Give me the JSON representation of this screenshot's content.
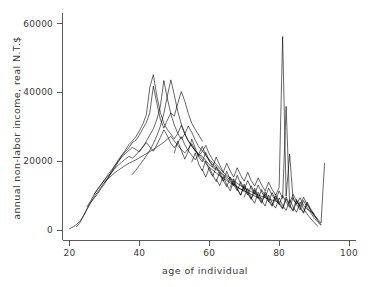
{
  "chart_data": {
    "type": "line",
    "title": "",
    "xlabel": "age of individual",
    "ylabel": "annual non-labor income, real N.T.$",
    "xlim": [
      18,
      102
    ],
    "ylim": [
      -3000,
      63000
    ],
    "grid": false,
    "legend": null,
    "xticks": [
      20,
      40,
      60,
      80,
      100
    ],
    "xtick_labels": [
      "20",
      "40",
      "60",
      "80",
      "100"
    ],
    "yticks": [
      0,
      20000,
      40000,
      60000
    ],
    "ytick_labels": [
      "0",
      "20000",
      "40000",
      "60000"
    ],
    "series": [
      {
        "name": "cohort-1",
        "x": [
          20,
          21,
          22,
          23,
          24,
          25,
          26,
          27,
          28,
          29,
          30,
          31,
          32,
          33,
          34,
          35,
          36,
          37,
          38,
          39,
          40,
          41,
          42,
          43,
          44,
          45,
          46,
          47,
          48,
          49,
          50,
          51,
          52,
          53,
          54,
          55,
          56,
          57,
          58
        ],
        "y": [
          400,
          900,
          1600,
          2600,
          4200,
          6200,
          8000,
          9200,
          10500,
          12000,
          13400,
          15000,
          16600,
          18200,
          19900,
          21600,
          22800,
          23900,
          25400,
          26100,
          27600,
          29500,
          31200,
          34200,
          41800,
          36800,
          32200,
          29600,
          31900,
          34000,
          33100,
          36800,
          40200,
          37400,
          33900,
          31000,
          29200,
          27600,
          25800
        ]
      },
      {
        "name": "cohort-2",
        "x": [
          22,
          23,
          24,
          25,
          26,
          27,
          28,
          29,
          30,
          31,
          32,
          33,
          34,
          35,
          36,
          37,
          38,
          39,
          40,
          41,
          42,
          43,
          44,
          45,
          46,
          47,
          48,
          49,
          50,
          51,
          52,
          53,
          54,
          55,
          56,
          57,
          58,
          59,
          60,
          61,
          62
        ],
        "y": [
          1000,
          2200,
          4100,
          6000,
          7800,
          9600,
          11000,
          12400,
          13900,
          15100,
          16900,
          18700,
          20400,
          21800,
          23200,
          24800,
          25900,
          27100,
          28800,
          30800,
          33500,
          41500,
          45100,
          38900,
          34200,
          31000,
          29200,
          27900,
          26500,
          28100,
          30400,
          27900,
          25800,
          24400,
          23100,
          22000,
          21400,
          20200,
          19000,
          18200,
          17500
        ]
      },
      {
        "name": "cohort-3",
        "x": [
          25,
          26,
          27,
          28,
          29,
          30,
          31,
          32,
          33,
          34,
          35,
          36,
          37,
          38,
          39,
          40,
          41,
          42,
          43,
          44,
          45,
          46,
          47,
          48,
          49,
          50,
          51,
          52,
          53,
          54,
          55,
          56,
          57,
          58,
          59,
          60,
          61,
          62,
          63,
          64,
          65,
          66
        ],
        "y": [
          6800,
          8400,
          10200,
          11800,
          13200,
          14600,
          16100,
          17400,
          18800,
          20000,
          21300,
          22200,
          23100,
          24000,
          23400,
          22700,
          24100,
          25800,
          27600,
          29400,
          32100,
          35900,
          43400,
          38200,
          33800,
          30500,
          28100,
          26400,
          27900,
          30200,
          28400,
          26100,
          24200,
          23000,
          21700,
          20400,
          19600,
          18400,
          17200,
          16100,
          15400,
          14600
        ]
      },
      {
        "name": "cohort-4",
        "x": [
          27,
          28,
          29,
          30,
          31,
          32,
          33,
          34,
          35,
          36,
          37,
          38,
          39,
          40,
          41,
          42,
          43,
          44,
          45,
          46,
          47,
          48,
          49,
          50,
          51,
          52,
          53,
          54,
          55,
          56,
          57,
          58,
          59,
          60,
          61,
          62,
          63,
          64,
          65,
          66,
          67,
          68,
          69,
          70
        ],
        "y": [
          10400,
          11800,
          13100,
          14500,
          15600,
          16800,
          17900,
          18900,
          19800,
          20600,
          21400,
          20900,
          21800,
          23000,
          24200,
          25400,
          24100,
          22900,
          24800,
          26900,
          29100,
          27400,
          25200,
          23900,
          25400,
          27100,
          24800,
          23000,
          21700,
          20400,
          22100,
          24300,
          21800,
          20100,
          18900,
          17800,
          16900,
          15800,
          14900,
          14100,
          13400,
          12600,
          11900,
          11200
        ]
      },
      {
        "name": "cohort-5",
        "x": [
          30,
          31,
          32,
          33,
          34,
          35,
          36,
          37,
          38,
          39,
          40,
          41,
          42,
          43,
          44,
          45,
          46,
          47,
          48,
          49,
          50,
          51,
          52,
          53,
          54,
          55,
          56,
          57,
          58,
          59,
          60,
          61,
          62,
          63,
          64,
          65,
          66,
          67,
          68,
          69,
          70,
          71,
          72,
          73,
          74,
          75
        ],
        "y": [
          13800,
          14900,
          15800,
          16700,
          17400,
          18100,
          18800,
          19400,
          19900,
          20400,
          21000,
          21600,
          22200,
          22800,
          23400,
          24100,
          24800,
          25500,
          26400,
          27200,
          25900,
          24600,
          23400,
          22400,
          23600,
          25100,
          23200,
          21800,
          20600,
          19400,
          18300,
          17400,
          16600,
          15800,
          15100,
          14400,
          13700,
          13100,
          12500,
          11900,
          11400,
          10900,
          10400,
          9900,
          9500,
          9100
        ]
      },
      {
        "name": "cohort-6",
        "x": [
          38,
          39,
          40,
          41,
          42,
          43,
          44,
          45,
          46,
          47,
          48,
          49,
          50,
          51,
          52,
          53,
          54,
          55,
          56,
          57,
          58,
          59,
          60,
          61,
          62,
          63,
          64,
          65,
          66,
          67,
          68,
          69,
          70,
          71,
          72,
          73,
          74,
          75,
          76,
          77,
          78,
          79,
          80
        ],
        "y": [
          16200,
          17400,
          18800,
          20100,
          21600,
          23200,
          25100,
          27400,
          30100,
          33800,
          38900,
          43600,
          39200,
          34400,
          30800,
          28100,
          26000,
          24400,
          22900,
          21600,
          22800,
          24600,
          22100,
          20400,
          19100,
          17900,
          16800,
          15900,
          15100,
          14300,
          13600,
          12900,
          12300,
          11700,
          11200,
          10700,
          10200,
          9800,
          9400,
          9000,
          8700,
          8400,
          8100
        ]
      },
      {
        "name": "cohort-7",
        "x": [
          50,
          51,
          52,
          53,
          54,
          55,
          56,
          57,
          58,
          59,
          60,
          61,
          62,
          63,
          64,
          65,
          66,
          67,
          68,
          69,
          70,
          71,
          72,
          73,
          74,
          75,
          76,
          77,
          78,
          79,
          80,
          81,
          82,
          83,
          84,
          85,
          86,
          87,
          88,
          89,
          90
        ],
        "y": [
          22400,
          25800,
          23100,
          20600,
          22900,
          26400,
          23800,
          21200,
          19800,
          22600,
          20100,
          18400,
          21200,
          18900,
          16800,
          19400,
          17200,
          15400,
          18100,
          15900,
          14200,
          16800,
          14400,
          12800,
          15200,
          13100,
          11400,
          13900,
          11800,
          10200,
          12400,
          56200,
          9800,
          22100,
          8900,
          7600,
          9400,
          7200,
          6100,
          5400,
          4800
        ]
      },
      {
        "name": "cohort-8",
        "x": [
          55,
          56,
          57,
          58,
          59,
          60,
          61,
          62,
          63,
          64,
          65,
          66,
          67,
          68,
          69,
          70,
          71,
          72,
          73,
          74,
          75,
          76,
          77,
          78,
          79,
          80,
          81,
          82,
          83,
          84,
          85,
          86,
          87,
          88,
          89,
          90,
          91
        ],
        "y": [
          19800,
          22400,
          19100,
          17200,
          20100,
          17400,
          15600,
          18400,
          16100,
          14200,
          17100,
          14800,
          12900,
          15900,
          13400,
          11600,
          14400,
          12200,
          10400,
          13100,
          11000,
          9400,
          12200,
          10100,
          8600,
          11400,
          9200,
          35900,
          7800,
          10400,
          8400,
          6900,
          9600,
          7400,
          5800,
          4200,
          3100
        ]
      },
      {
        "name": "cohort-9",
        "x": [
          58,
          59,
          60,
          61,
          62,
          63,
          64,
          65,
          66,
          67,
          68,
          69,
          70,
          71,
          72,
          73,
          74,
          75,
          76,
          77,
          78,
          79,
          80,
          81,
          82,
          83,
          84,
          85,
          86,
          87,
          88,
          89,
          90,
          91,
          92
        ],
        "y": [
          17600,
          15400,
          18200,
          15900,
          14100,
          16800,
          14400,
          12600,
          15400,
          13200,
          11400,
          14100,
          11900,
          10200,
          12900,
          10800,
          9200,
          11800,
          9800,
          8200,
          10900,
          8900,
          7400,
          10100,
          8100,
          6600,
          9400,
          7400,
          5900,
          8600,
          6600,
          5100,
          3600,
          2400,
          1400
        ]
      },
      {
        "name": "cohort-10",
        "x": [
          62,
          63,
          64,
          65,
          66,
          67,
          68,
          69,
          70,
          71,
          72,
          73,
          74,
          75,
          76,
          77,
          78,
          79,
          80,
          81,
          82,
          83,
          84,
          85,
          86,
          87,
          88,
          89,
          90,
          91,
          92,
          93
        ],
        "y": [
          14800,
          12900,
          15600,
          13200,
          11400,
          14200,
          11900,
          10100,
          12800,
          10600,
          8900,
          11600,
          9400,
          7800,
          10600,
          8400,
          6900,
          9800,
          7600,
          6100,
          9100,
          7000,
          5500,
          8400,
          6400,
          4900,
          7800,
          5900,
          4400,
          3200,
          2100,
          19400
        ]
      },
      {
        "name": "cohort-11",
        "x": [
          66,
          67,
          68,
          69,
          70,
          71,
          72,
          73,
          74,
          75,
          76,
          77,
          78,
          79,
          80,
          81,
          82,
          83,
          84,
          85,
          86,
          87,
          88,
          89,
          90,
          91,
          92
        ],
        "y": [
          12400,
          14900,
          12100,
          10200,
          13400,
          10900,
          9100,
          12200,
          9800,
          8100,
          11200,
          8900,
          7200,
          10400,
          8100,
          6400,
          9600,
          7400,
          5800,
          8900,
          6800,
          5200,
          8200,
          6200,
          4600,
          2900,
          1600
        ]
      },
      {
        "name": "cohort-12",
        "x": [
          70,
          71,
          72,
          73,
          74,
          75,
          76,
          77,
          78,
          79,
          80,
          81,
          82,
          83,
          84,
          85,
          86,
          87,
          88,
          89,
          90,
          91
        ],
        "y": [
          9600,
          12100,
          9400,
          7800,
          11000,
          8600,
          7000,
          10200,
          7900,
          6400,
          9400,
          7200,
          5700,
          8800,
          6700,
          5200,
          8200,
          6200,
          4700,
          3400,
          2200,
          1200
        ]
      }
    ],
    "annotations": [
      {
        "label": "peak-spike",
        "x": 81,
        "y": 56200
      },
      {
        "label": "secondary-spike",
        "x": 82,
        "y": 35900
      },
      {
        "label": "terminal-rise",
        "x": 93,
        "y": 19400
      }
    ]
  }
}
